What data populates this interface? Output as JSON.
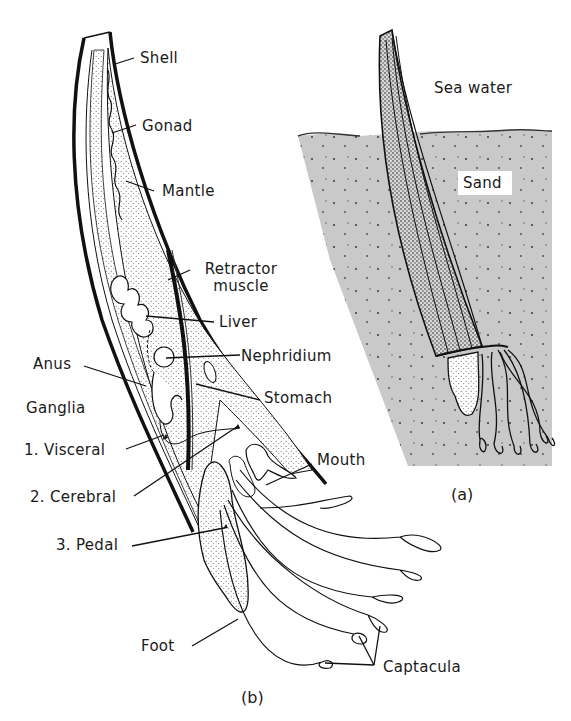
{
  "figure": {
    "panel_a": {
      "caption": "(a)",
      "labels": {
        "sea_water": "Sea water",
        "sand": "Sand"
      },
      "colors": {
        "sand": "#c9c9c9",
        "water": "#ffffff",
        "ink": "#1a1a1a"
      }
    },
    "panel_b": {
      "caption": "(b)",
      "labels": {
        "shell": "Shell",
        "gonad": "Gonad",
        "mantle": "Mantle",
        "retractor_line1": "Retractor",
        "retractor_line2": "muscle",
        "liver": "Liver",
        "anus": "Anus",
        "nephridium": "Nephridium",
        "stomach": "Stomach",
        "ganglia": "Ganglia",
        "visceral": "1. Visceral",
        "cerebral": "2. Cerebral",
        "pedal": "3. Pedal",
        "mouth": "Mouth",
        "foot": "Foot",
        "captacula": "Captacula"
      }
    }
  }
}
